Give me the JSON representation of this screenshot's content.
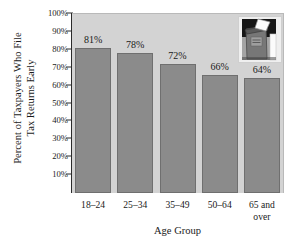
{
  "chart_data": {
    "type": "bar",
    "title": "",
    "categories": [
      "18–24",
      "25–34",
      "35–49",
      "50–64",
      "65 and over"
    ],
    "category_lines": [
      [
        "18–24"
      ],
      [
        "25–34"
      ],
      [
        "35–49"
      ],
      [
        "50–64"
      ],
      [
        "65 and",
        "over"
      ]
    ],
    "values": [
      81,
      78,
      72,
      66,
      64
    ],
    "value_labels": [
      "81%",
      "78%",
      "72%",
      "66%",
      "64%"
    ],
    "xlabel": "Age Group",
    "ylabel_lines": [
      "Percent of Taxpayers Who File",
      "Tax Returns Early"
    ],
    "ylim": [
      0,
      100
    ],
    "ytick_values": [
      10,
      20,
      30,
      40,
      50,
      60,
      70,
      80,
      90,
      100
    ],
    "ytick_labels": [
      "10%",
      "20%",
      "30%",
      "40%",
      "50%",
      "60%",
      "70%",
      "80%",
      "90%",
      "100%"
    ],
    "grid": false,
    "legend": null,
    "bar_color": "#8b8b8b",
    "bar_edge_color": "#6f6f6f",
    "plot_background": "#d3d3d3",
    "axis_color": "#2b2b2b",
    "text_color": "#1a1a1a"
  },
  "inset": {
    "name": "mailbox-photo",
    "description": "mailbox with envelope"
  }
}
